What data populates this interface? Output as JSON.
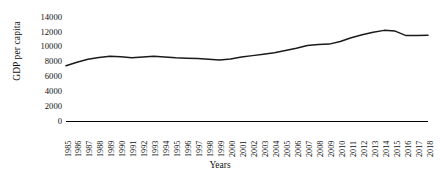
{
  "chart_data": {
    "type": "line",
    "title": "",
    "xlabel": "Years",
    "ylabel": "GDP per capita",
    "ylim": [
      0,
      14000
    ],
    "ytick_values": [
      0,
      2000,
      4000,
      6000,
      8000,
      10000,
      12000,
      14000
    ],
    "ytick_labels": [
      "0",
      "2000",
      "4000",
      "6000",
      "8000",
      "10000",
      "12000",
      "14000"
    ],
    "grid": false,
    "legend": "none",
    "line_color": "#1a1a1a",
    "categories": [
      "1985",
      "1986",
      "1987",
      "1988",
      "1989",
      "1990",
      "1991",
      "1992",
      "1993",
      "1994",
      "1995",
      "1996",
      "1997",
      "1998",
      "1999",
      "2000",
      "2001",
      "2002",
      "2003",
      "2004",
      "2005",
      "2006",
      "2007",
      "2008",
      "2009",
      "2010",
      "2011",
      "2012",
      "2013",
      "2014",
      "2015",
      "2016",
      "2017",
      "2018"
    ],
    "x": [
      1985,
      1986,
      1987,
      1988,
      1989,
      1990,
      1991,
      1992,
      1993,
      1994,
      1995,
      1996,
      1997,
      1998,
      1999,
      2000,
      2001,
      2002,
      2003,
      2004,
      2005,
      2006,
      2007,
      2008,
      2009,
      2010,
      2011,
      2012,
      2013,
      2014,
      2015,
      2016,
      2017,
      2018
    ],
    "values": [
      7450,
      7900,
      8300,
      8550,
      8700,
      8650,
      8500,
      8600,
      8700,
      8600,
      8500,
      8450,
      8400,
      8300,
      8200,
      8350,
      8600,
      8800,
      9000,
      9200,
      9500,
      9800,
      10150,
      10300,
      10350,
      10700,
      11200,
      11600,
      11950,
      12200,
      12100,
      11500,
      11500,
      11550
    ]
  }
}
